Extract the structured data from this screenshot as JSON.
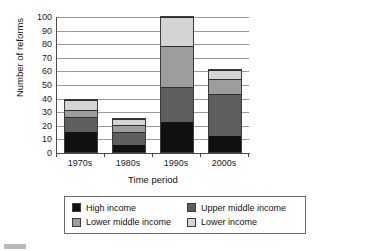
{
  "chart_data": {
    "type": "bar",
    "stacked": true,
    "title": "",
    "xlabel": "Time period",
    "ylabel": "Number of reforms",
    "categories": [
      "1970s",
      "1980s",
      "1990s",
      "2000s"
    ],
    "ylim": [
      0,
      100
    ],
    "yticks": [
      0,
      10,
      20,
      30,
      40,
      50,
      60,
      70,
      80,
      90,
      100
    ],
    "grid": true,
    "legend_position": "bottom",
    "series": [
      {
        "name": "High income",
        "color": "#111111",
        "values": [
          15,
          5,
          22,
          12
        ]
      },
      {
        "name": "Upper middle income",
        "color": "#5f5f5f",
        "values": [
          11,
          10,
          26,
          31
        ]
      },
      {
        "name": "Lower middle income",
        "color": "#9d9d9d",
        "values": [
          5,
          5,
          30,
          11
        ]
      },
      {
        "name": "Lower income",
        "color": "#d4d4d4",
        "values": [
          7,
          4,
          21,
          6
        ]
      }
    ],
    "totals": [
      38,
      24,
      99,
      60
    ]
  },
  "legend": {
    "items": [
      {
        "label": "High income"
      },
      {
        "label": "Upper middle income"
      },
      {
        "label": "Lower middle income"
      },
      {
        "label": "Lower income"
      }
    ]
  },
  "axis": {
    "y_title": "Number of reforms",
    "x_title": "Time period",
    "y_tick_labels": [
      "100",
      "90",
      "80",
      "70",
      "60",
      "50",
      "40",
      "30",
      "20",
      "10",
      "0"
    ],
    "x_tick_labels": [
      "1970s",
      "1980s",
      "1990s",
      "2000s"
    ]
  }
}
